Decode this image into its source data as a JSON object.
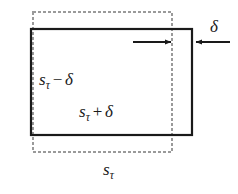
{
  "figure": {
    "kind": "geometry-diagram",
    "background_color": "#ffffff",
    "width": 238,
    "height": 194
  },
  "shapes": {
    "dashed_rect": {
      "name": "reference-window",
      "x": 33,
      "y": 12,
      "width": 139,
      "height": 140,
      "stroke_color": "#9a9a9a",
      "stroke_width": 2,
      "dash_pattern": "3 2",
      "fill": "none",
      "label": "sτ"
    },
    "solid_rect": {
      "name": "shifted-window",
      "x": 31,
      "y": 29,
      "width": 161,
      "height": 106,
      "stroke_color": "#1a1a1a",
      "stroke_width": 2.2,
      "fill": "none"
    }
  },
  "arrows": {
    "shift_arrow": {
      "name": "rightward-shift-arrow",
      "direction": "right",
      "x1": 133,
      "y1": 42,
      "x2": 173,
      "y2": 42,
      "color": "#1a1a1a"
    },
    "delta_arrow": {
      "name": "delta-measure-arrow",
      "direction": "left",
      "x1": 230,
      "y1": 42,
      "x2": 194,
      "y2": 42,
      "color": "#1a1a1a"
    }
  },
  "labels": {
    "inner_minus": {
      "s": "s",
      "sub": "τ",
      "op": "−",
      "delta": "δ",
      "full_text": "sτ − δ"
    },
    "inner_plus": {
      "s": "s",
      "sub": "τ",
      "op": "+",
      "delta": "δ",
      "full_text": "sτ + δ"
    },
    "bottom": {
      "s": "s",
      "sub": "τ",
      "full_text": "sτ"
    },
    "delta_top": {
      "delta": "δ",
      "full_text": "δ"
    }
  },
  "colors": {
    "ink": "#1a1a1a",
    "dashed_gray": "#9a9a9a",
    "background": "#ffffff"
  }
}
